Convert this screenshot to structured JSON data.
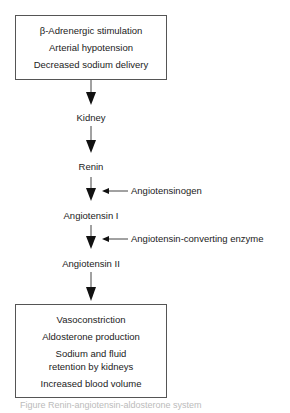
{
  "top_box": {
    "lines": [
      "β-Adrenergic stimulation",
      "Arterial hypotension",
      "Decreased sodium delivery"
    ]
  },
  "flow": {
    "kidney": "Kidney",
    "renin": "Renin",
    "angiotensin_i": "Angiotensin I",
    "angiotensin_ii": "Angiotensin II"
  },
  "side_inputs": {
    "angiotensinogen": "Angiotensinogen",
    "ace": "Angiotensin-converting enzyme"
  },
  "bottom_box": {
    "lines": [
      "Vasoconstriction",
      "Aldosterone production",
      "Sodium and fluid",
      "retention by kidneys",
      "Increased blood volume"
    ]
  },
  "caption": "Figure    Renin-angiotensin-aldosterone system"
}
